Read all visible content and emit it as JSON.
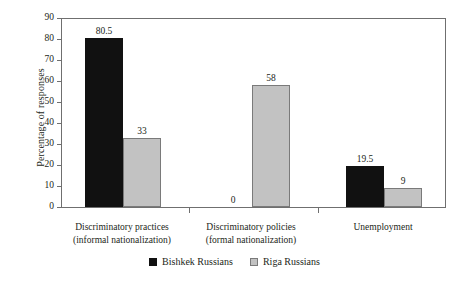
{
  "chart_data": {
    "type": "bar",
    "title": "",
    "xlabel": "",
    "ylabel": "Percentage of responses",
    "ylim": [
      0,
      90
    ],
    "ytick_step": 10,
    "yticks": [
      90,
      80,
      70,
      60,
      50,
      40,
      30,
      20,
      10,
      0
    ],
    "grid": false,
    "legend_position": "bottom-center",
    "categories": [
      "Discriminatory practices\n(informal nationalization)",
      "Discriminatory policies\n(formal nationalization)",
      "Unemployment"
    ],
    "category_lines": [
      [
        "Discriminatory practices",
        "(informal nationalization)"
      ],
      [
        "Discriminatory policies",
        "(formal nationalization)"
      ],
      [
        "Unemployment",
        ""
      ]
    ],
    "series": [
      {
        "name": "Bishkek Russians",
        "color": "#111111",
        "values": [
          80.5,
          0,
          19.5
        ],
        "labels": [
          "80.5",
          "0",
          "19.5"
        ]
      },
      {
        "name": "Riga Russians",
        "color": "#c2c2c2",
        "values": [
          33,
          58,
          9
        ],
        "labels": [
          "33",
          "58",
          "9"
        ]
      }
    ]
  },
  "axis": {
    "y_title": "Percentage of responses",
    "tick_labels": [
      "90",
      "80",
      "70",
      "60",
      "50",
      "40",
      "30",
      "20",
      "10",
      "0"
    ]
  },
  "legend": {
    "items": [
      {
        "label": "Bishkek Russians",
        "swatch": "black-square-icon"
      },
      {
        "label": "Riga Russians",
        "swatch": "gray-square-icon"
      }
    ]
  }
}
